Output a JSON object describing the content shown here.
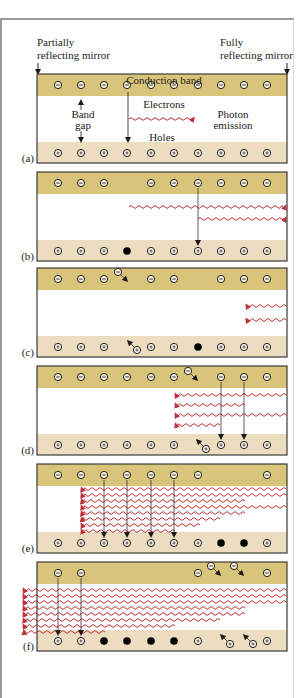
{
  "figure": {
    "mirrors": {
      "left_label_line1": "Partially",
      "left_label_line2": "reflecting mirror",
      "right_label_line1": "Fully",
      "right_label_line2": "reflecting mirror"
    },
    "annotations": {
      "conduction_band": "Conduction band",
      "electrons": "Electrons",
      "band_gap_line1": "Band",
      "band_gap_line2": "gap",
      "photon_line1": "Photon",
      "photon_line2": "emission",
      "holes": "Holes"
    },
    "colors": {
      "conduction_band": "#d9c57a",
      "valence_band": "#ecdcc0",
      "photon_wave": "#c0303a",
      "panel_border": "#3a3a3a",
      "particle": "#1a1a1a"
    },
    "columns_x": [
      58,
      81,
      104,
      127,
      151,
      174,
      198,
      221,
      244,
      267
    ],
    "panels": [
      {
        "label": "(a)",
        "top": 74,
        "electrons": [
          0,
          1,
          2,
          3,
          4,
          5,
          6,
          7,
          8,
          9
        ],
        "holes_open": [
          0,
          1,
          2,
          3,
          4,
          5,
          6,
          7,
          8,
          9
        ],
        "holes_filled": [],
        "transitions": [],
        "waves": [],
        "moving_electrons": [],
        "moving_holes": []
      },
      {
        "label": "(b)",
        "top": 172,
        "electrons": [
          0,
          1,
          2,
          4,
          5,
          6,
          7,
          8,
          9
        ],
        "holes_open": [
          0,
          1,
          2,
          4,
          5,
          6,
          7,
          8,
          9
        ],
        "holes_filled": [
          3
        ],
        "transitions": [
          6
        ],
        "waves": [
          {
            "y": 35,
            "x1": 129,
            "x2": 285,
            "dir": "right"
          },
          {
            "y": 47,
            "x1": 198,
            "x2": 285,
            "dir": "right"
          }
        ],
        "moving_electrons": [],
        "moving_holes": []
      },
      {
        "label": "(c)",
        "top": 268,
        "electrons": [
          0,
          1,
          2,
          4,
          5,
          7,
          8,
          9
        ],
        "holes_open": [
          0,
          1,
          2,
          4,
          5,
          7,
          8,
          9
        ],
        "holes_filled": [
          6
        ],
        "transitions": [],
        "waves": [
          {
            "y": 38,
            "x1": 247,
            "x2": 286,
            "dir": "left"
          },
          {
            "y": 52,
            "x1": 247,
            "x2": 286,
            "dir": "left"
          }
        ],
        "moving_electrons": [
          {
            "x": 118,
            "y": 4
          }
        ],
        "moving_holes": [
          {
            "x": 137,
            "y": 82
          }
        ]
      },
      {
        "label": "(d)",
        "top": 366,
        "electrons": [
          0,
          1,
          2,
          3,
          4,
          5,
          7,
          8,
          9
        ],
        "holes_open": [
          0,
          1,
          2,
          3,
          4,
          5,
          7,
          8,
          9
        ],
        "holes_filled": [],
        "transitions": [
          7,
          8
        ],
        "waves": [
          {
            "y": 29,
            "x1": 176,
            "x2": 286,
            "dir": "left"
          },
          {
            "y": 39,
            "x1": 176,
            "x2": 245,
            "dir": "left"
          },
          {
            "y": 49,
            "x1": 176,
            "x2": 286,
            "dir": "left"
          },
          {
            "y": 59,
            "x1": 176,
            "x2": 220,
            "dir": "left"
          }
        ],
        "moving_electrons": [
          {
            "x": 188,
            "y": 5
          }
        ],
        "moving_holes": [
          {
            "x": 206,
            "y": 83
          }
        ]
      },
      {
        "label": "(e)",
        "top": 464,
        "electrons": [
          0,
          1,
          2,
          3,
          4,
          5,
          6,
          9
        ],
        "holes_open": [
          0,
          1,
          2,
          3,
          4,
          5,
          6,
          9
        ],
        "holes_filled": [
          7,
          8
        ],
        "transitions": [
          2,
          3,
          4,
          5
        ],
        "waves": [
          {
            "y": 25,
            "x1": 82,
            "x2": 286,
            "dir": "left"
          },
          {
            "y": 31,
            "x1": 82,
            "x2": 286,
            "dir": "left"
          },
          {
            "y": 37,
            "x1": 82,
            "x2": 245,
            "dir": "left"
          },
          {
            "y": 43,
            "x1": 82,
            "x2": 286,
            "dir": "left"
          },
          {
            "y": 49,
            "x1": 82,
            "x2": 245,
            "dir": "left"
          },
          {
            "y": 55,
            "x1": 82,
            "x2": 220,
            "dir": "left"
          },
          {
            "y": 61,
            "x1": 82,
            "x2": 200,
            "dir": "left"
          },
          {
            "y": 67,
            "x1": 82,
            "x2": 175,
            "dir": "left"
          }
        ],
        "moving_electrons": [],
        "moving_holes": []
      },
      {
        "label": "(f)",
        "top": 562,
        "electrons": [
          0,
          1,
          6,
          9
        ],
        "holes_open": [
          0,
          1,
          6,
          9
        ],
        "holes_filled": [
          2,
          3,
          4,
          5
        ],
        "transitions": [
          0,
          1
        ],
        "waves": [
          {
            "y": 28,
            "x1": 24,
            "x2": 286,
            "dir": "left"
          },
          {
            "y": 34,
            "x1": 24,
            "x2": 286,
            "dir": "left"
          },
          {
            "y": 40,
            "x1": 24,
            "x2": 286,
            "dir": "left"
          },
          {
            "y": 46,
            "x1": 24,
            "x2": 245,
            "dir": "left"
          },
          {
            "y": 52,
            "x1": 24,
            "x2": 245,
            "dir": "left"
          },
          {
            "y": 58,
            "x1": 24,
            "x2": 220,
            "dir": "left"
          },
          {
            "y": 64,
            "x1": 24,
            "x2": 175,
            "dir": "left"
          },
          {
            "y": 70,
            "x1": 24,
            "x2": 105,
            "dir": "left"
          }
        ],
        "moving_electrons": [
          {
            "x": 211,
            "y": 4
          },
          {
            "x": 234,
            "y": 4
          }
        ],
        "moving_holes": [
          {
            "x": 230,
            "y": 82
          },
          {
            "x": 253,
            "y": 82
          }
        ]
      }
    ]
  }
}
